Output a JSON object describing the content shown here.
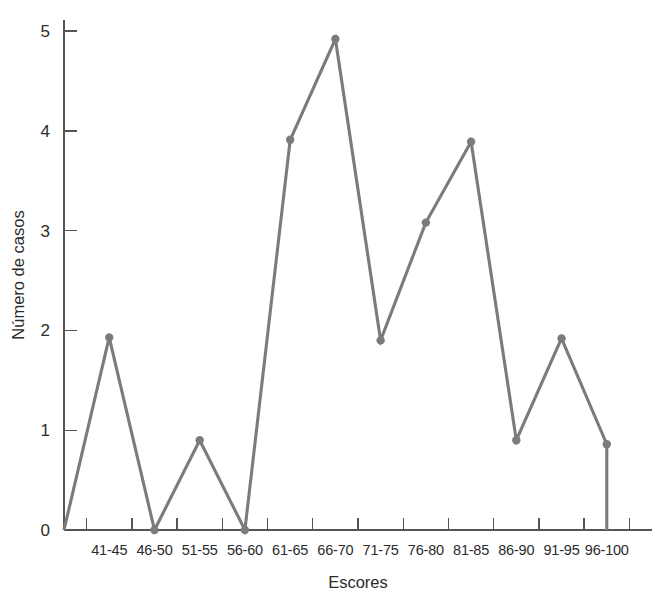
{
  "chart_data": {
    "type": "line",
    "title": "",
    "subtitle": "",
    "xlabel": "Escores",
    "ylabel": "Número de casos",
    "categories": [
      "41-45",
      "46-50",
      "51-55",
      "56-60",
      "61-65",
      "66-70",
      "71-75",
      "76-80",
      "81-85",
      "86-90",
      "91-95",
      "96-100"
    ],
    "values": [
      1.93,
      0.0,
      0.9,
      0.0,
      3.91,
      4.92,
      1.9,
      3.08,
      3.89,
      0.9,
      1.92,
      0.86
    ],
    "series": [
      {
        "name": "Número de casos",
        "values": [
          1.93,
          0.0,
          0.9,
          0.0,
          3.91,
          4.92,
          1.9,
          3.08,
          3.89,
          0.9,
          1.92,
          0.86
        ]
      }
    ],
    "anchor_start": {
      "label": "baseline-left",
      "value": 0.0
    },
    "anchor_end": {
      "label": "baseline-right",
      "value": 0.0
    },
    "ylim": [
      0,
      5.25
    ],
    "yticks": [
      0,
      1,
      2,
      3,
      4,
      5
    ],
    "ytick_labels": [
      "0",
      "1",
      "2",
      "3",
      "4",
      "5"
    ],
    "xlim": [
      0,
      13
    ],
    "grid": false,
    "legend": false,
    "legend_position": "none",
    "line_color": "#7b7b7b",
    "marker_color": "#7b7b7b",
    "axis_color": "#555555",
    "text_color": "#2b2b2b",
    "background_color": "#ffffff"
  },
  "axes": {
    "y_title": "Número de casos",
    "x_title": "Escores"
  }
}
